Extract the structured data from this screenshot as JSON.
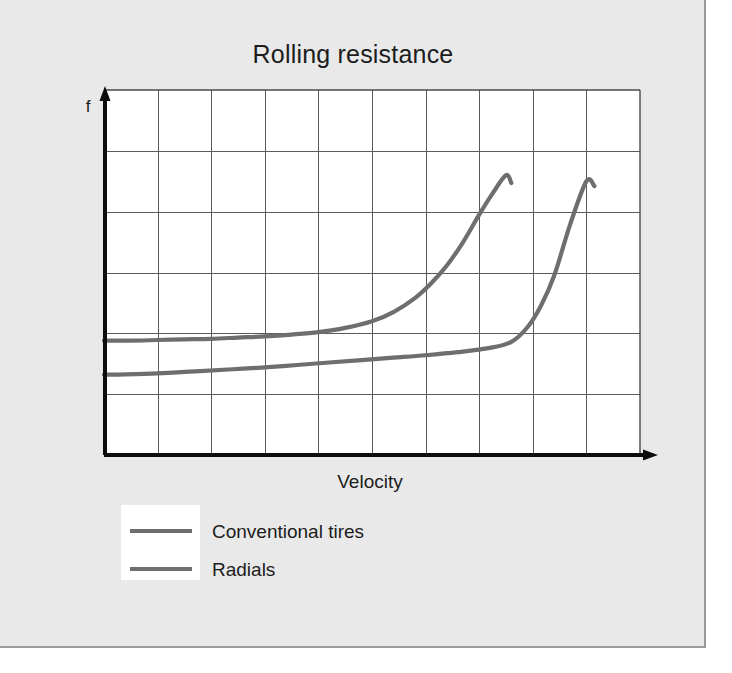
{
  "slide": {
    "background_color": "#e9e9ea",
    "border_color": "#9a9a9a"
  },
  "chart_data": {
    "type": "line",
    "title": "Rolling resistance",
    "xlabel": "Velocity",
    "ylabel": "f",
    "grid": true,
    "grid_columns": 10,
    "grid_rows": 6,
    "axis_arrows": true,
    "legend_position": "below-left",
    "line_color": "#6e6e6e",
    "axis_color": "#0d0d0d",
    "grid_color": "#5a5a5a",
    "xlim": [
      0,
      10
    ],
    "ylim": [
      0,
      6
    ],
    "xticks": [
      0,
      1,
      2,
      3,
      4,
      5,
      6,
      7,
      8,
      9,
      10
    ],
    "yticks": [
      0,
      1,
      2,
      3,
      4,
      5,
      6
    ],
    "xticklabels": [],
    "yticklabels": [],
    "series": [
      {
        "name": "Conventional tires",
        "color": "#6e6e6e",
        "x": [
          0.0,
          0.5,
          1.0,
          1.5,
          2.0,
          2.5,
          3.0,
          3.5,
          4.0,
          4.5,
          5.0,
          5.4,
          5.8,
          6.1,
          6.4,
          6.7,
          7.0,
          7.25,
          7.5,
          7.6
        ],
        "y": [
          1.88,
          1.88,
          1.89,
          1.9,
          1.91,
          1.93,
          1.95,
          1.98,
          2.02,
          2.09,
          2.2,
          2.35,
          2.58,
          2.82,
          3.12,
          3.5,
          3.95,
          4.3,
          4.6,
          4.47
        ]
      },
      {
        "name": "Radials",
        "color": "#6e6e6e",
        "x": [
          0.0,
          0.6,
          1.2,
          1.8,
          2.4,
          3.0,
          3.6,
          4.2,
          4.8,
          5.4,
          6.0,
          6.6,
          7.2,
          7.6,
          7.9,
          8.15,
          8.4,
          8.7,
          9.0,
          9.15
        ],
        "y": [
          1.32,
          1.33,
          1.35,
          1.38,
          1.41,
          1.44,
          1.48,
          1.52,
          1.56,
          1.6,
          1.64,
          1.69,
          1.76,
          1.86,
          2.1,
          2.45,
          2.95,
          3.8,
          4.5,
          4.42
        ]
      }
    ]
  },
  "legend": {
    "items": [
      {
        "label": "Conventional tires",
        "color": "#6e6e6e"
      },
      {
        "label": "Radials",
        "color": "#6e6e6e"
      }
    ]
  }
}
